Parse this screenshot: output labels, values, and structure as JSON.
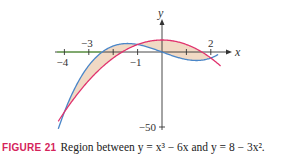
{
  "chart_data": {
    "type": "line",
    "xlabel": "x",
    "ylabel": "y",
    "xlim": [
      -4.25,
      2.4
    ],
    "ylim": [
      -52,
      20
    ],
    "grid": false,
    "legend": null,
    "x_ticks": [
      -4,
      -3,
      -2,
      -1,
      1,
      2
    ],
    "x_tick_labels": [
      {
        "value": -4,
        "label": "−4",
        "color": "#3b6cb7",
        "position": "below"
      },
      {
        "value": -3,
        "label": "−3",
        "color": "#5a8f2e",
        "position": "above"
      },
      {
        "value": -1,
        "label": "−1",
        "color": "#333333",
        "position": "below"
      },
      {
        "value": 2,
        "label": "2",
        "color": "#333333",
        "position": "above"
      }
    ],
    "y_ticks": [
      -50
    ],
    "y_tick_labels": [
      {
        "value": -50,
        "label": "−50"
      }
    ],
    "series": [
      {
        "name": "y = x^3 − 6x",
        "color": "#4a86c8",
        "x": [
          -4.25,
          -4,
          -3.5,
          -3,
          -2.5,
          -2,
          -1.41,
          -1,
          -0.5,
          0,
          0.5,
          1,
          1.41,
          2,
          2.3
        ],
        "y": [
          -51.3,
          -40,
          -21.9,
          -9,
          0.4,
          4,
          5.66,
          5,
          2.9,
          0,
          -2.9,
          -5,
          -5.66,
          -4,
          -1.6
        ]
      },
      {
        "name": "y = 8 − 3x^2",
        "color": "#e0336e",
        "x": [
          -4.25,
          -4,
          -3.5,
          -3,
          -2.5,
          -2,
          -1.5,
          -1,
          -0.5,
          0,
          0.5,
          1,
          1.5,
          2,
          2.4
        ],
        "y": [
          -46.2,
          -40,
          -28.75,
          -19,
          -10.75,
          -4,
          1.25,
          5,
          7.25,
          8,
          7.25,
          5,
          1.25,
          -4,
          -9.3
        ]
      }
    ],
    "shaded_region": {
      "between": [
        "y = x^3 − 6x",
        "y = 8 − 3x^2"
      ],
      "x_range": [
        -4,
        2
      ],
      "color": "#f1d9c4",
      "intersections_x": [
        -4,
        -1,
        2
      ]
    },
    "highlight_segment": {
      "axis": "x",
      "from": -4.3,
      "to": -2.5,
      "color": "#5fae3a"
    }
  },
  "caption": {
    "figure_label": "FIGURE 21",
    "text": "Region between y = x³ − 6x and y = 8 − 3x²."
  }
}
